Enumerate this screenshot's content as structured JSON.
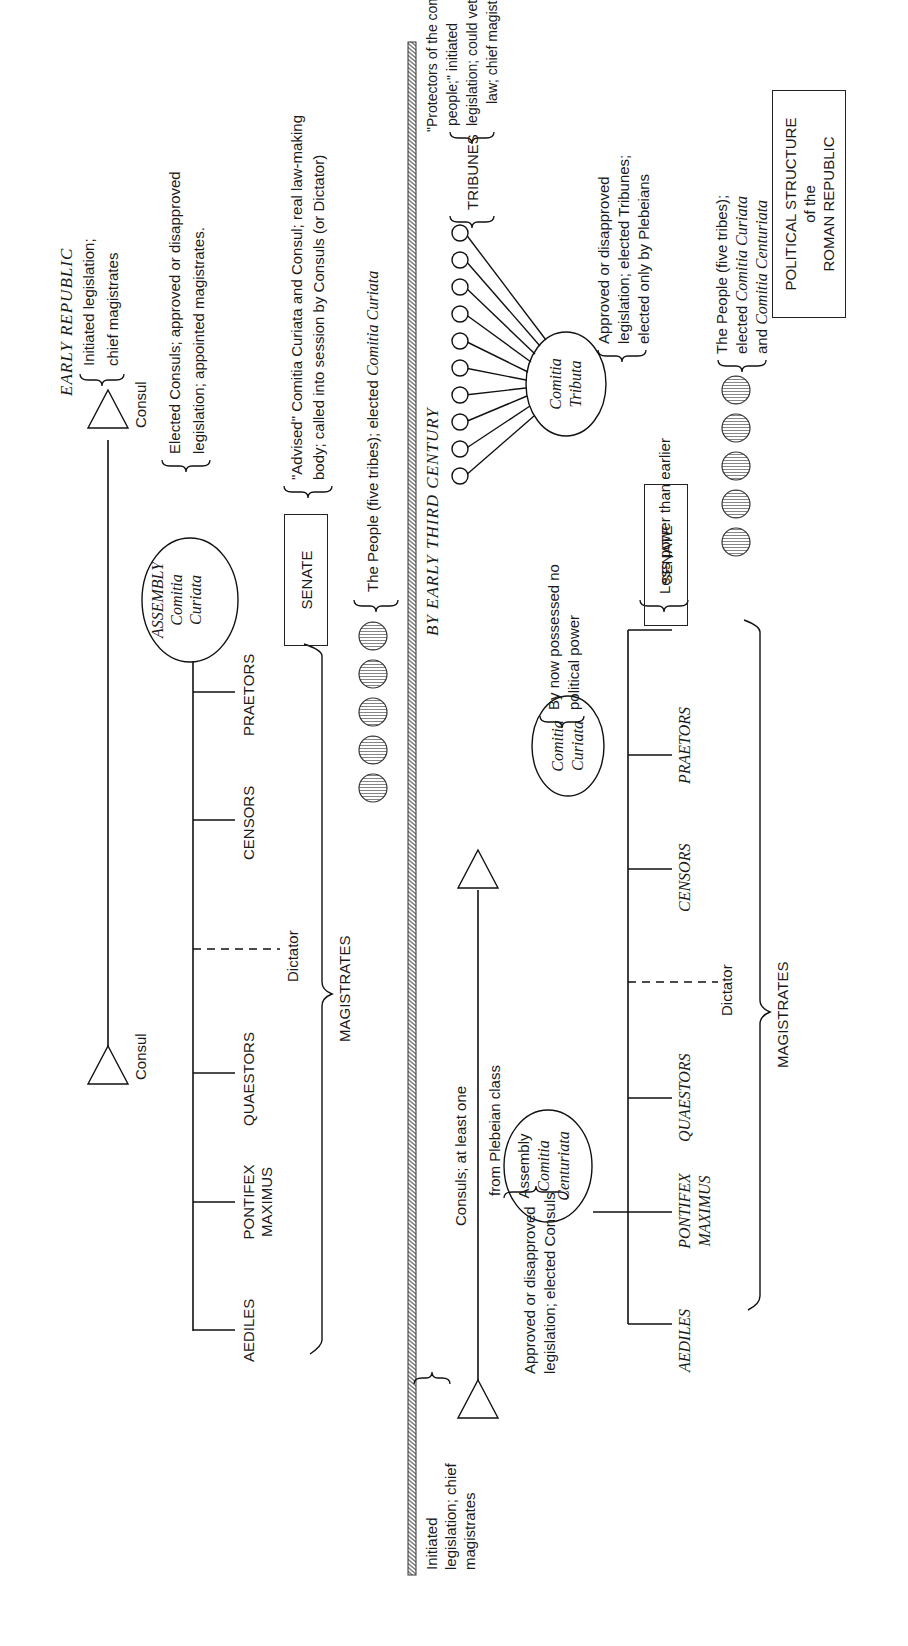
{
  "diagram": {
    "title_box": {
      "line1": "POLITICAL STRUCTURE",
      "line2": "of the",
      "line3": "ROMAN REPUBLIC"
    },
    "early_republic": {
      "heading": "EARLY REPUBLIC",
      "consul_left": "Consul",
      "consul_right": "Consul",
      "consul_note_1": "Initiated legislation;",
      "consul_note_2": "chief magistrates",
      "magistrates": [
        "AEDILES",
        "PONTIFEX",
        "MAXIMUS",
        "QUAESTORS",
        "CENSORS",
        "PRAETORS"
      ],
      "dictator": "Dictator",
      "magistrates_label": "MAGISTRATES",
      "assembly": {
        "line1": "ASSEMBLY",
        "line2": "Comitia",
        "line3": "Curiata"
      },
      "assembly_note_1": "Elected Consuls; approved or disapproved",
      "assembly_note_2": "legislation; appointed magistrates.",
      "senate": "SENATE",
      "senate_note_1": "\"Advised\" Comitia Curiata and Consul; real law-making",
      "senate_note_2": "body; called into session by Consuls (or Dictator)",
      "people_note_prefix": "The People (five tribes); elected ",
      "people_note_italic": "Comitia Curiata",
      "people_count": 5
    },
    "third_century": {
      "heading": "BY EARLY THIRD CENTURY",
      "consuls_note_1": "Consuls; at least one",
      "consuls_note_2": "from Plebeian class",
      "consul_left_note_1": "Initiated",
      "consul_left_note_2": "legislation; chief",
      "consul_left_note_3": "magistrates",
      "assembly": {
        "line1": "Assembly",
        "line2": "Comitia",
        "line3": "Centuriata"
      },
      "assembly_note_1": "Approved or disapproved",
      "assembly_note_2": "legislation; elected Consuls",
      "curiata": {
        "line1": "Comitia",
        "line2": "Curiata"
      },
      "curiata_note_1": "By now possessed no",
      "curiata_note_2": "political power",
      "magistrates": [
        "AEDILES",
        "PONTIFEX",
        "MAXIMUS",
        "QUAESTORS",
        "CENSORS",
        "PRAETORS"
      ],
      "dictator": "Dictator",
      "magistrates_label": "MAGISTRATES",
      "senate": "SENATE",
      "senate_note": "Less power than earlier",
      "people_note_1": "The People (five tribes);",
      "people_note_2_prefix": "elected ",
      "people_note_2_italic": "Comitia Curiata",
      "people_note_3_prefix": "and ",
      "people_note_3_italic": "Comitia Centuriata",
      "people_count": 5,
      "tributa": {
        "line1": "Comitia",
        "line2": "Tributa"
      },
      "tributa_note_1": "Approved or disapproved",
      "tributa_note_2": "legislation; elected Tribunes;",
      "tributa_note_3": "elected only by Plebeians",
      "tribune_circles": 10,
      "tribunes": "TRIBUNES",
      "tribunes_note_1": "\"Protectors of the common",
      "tribunes_note_2": "people;\" initiated",
      "tribunes_note_3": "legislation; could veto any",
      "tribunes_note_4": "law; chief magistrates"
    }
  }
}
